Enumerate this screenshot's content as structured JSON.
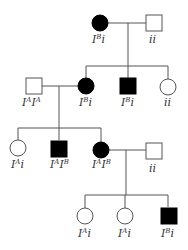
{
  "pedigree": {
    "colors": {
      "affected": "#000000",
      "unaffected": "#ffffff",
      "line": "#555555"
    },
    "generations": [
      {
        "id": "I",
        "individuals": [
          {
            "id": "I-1",
            "sex": "female",
            "affected": true,
            "genotype": {
              "base": "I",
              "sup": "B",
              "rest": "i"
            }
          },
          {
            "id": "I-2",
            "sex": "male",
            "affected": false,
            "genotype": {
              "base": "",
              "sup": "",
              "rest": "ii"
            }
          }
        ]
      },
      {
        "id": "II",
        "individuals": [
          {
            "id": "II-1",
            "sex": "male",
            "affected": false,
            "genotype": {
              "base": "I",
              "sup": "A",
              "rest": "I",
              "sup2": "A"
            }
          },
          {
            "id": "II-2",
            "sex": "female",
            "affected": true,
            "genotype": {
              "base": "I",
              "sup": "B",
              "rest": "i"
            }
          },
          {
            "id": "II-3",
            "sex": "male",
            "affected": true,
            "genotype": {
              "base": "I",
              "sup": "B",
              "rest": "i"
            }
          },
          {
            "id": "II-4",
            "sex": "female",
            "affected": false,
            "genotype": {
              "base": "",
              "sup": "",
              "rest": "ii"
            }
          }
        ]
      },
      {
        "id": "III",
        "individuals": [
          {
            "id": "III-1",
            "sex": "female",
            "affected": false,
            "genotype": {
              "base": "I",
              "sup": "A",
              "rest": "i"
            }
          },
          {
            "id": "III-2",
            "sex": "male",
            "affected": true,
            "genotype": {
              "base": "I",
              "sup": "A",
              "rest": "I",
              "sup2": "B"
            }
          },
          {
            "id": "III-3",
            "sex": "female",
            "affected": true,
            "genotype": {
              "base": "I",
              "sup": "A",
              "rest": "I",
              "sup2": "B"
            }
          },
          {
            "id": "III-4",
            "sex": "male",
            "affected": false,
            "genotype": {
              "base": "",
              "sup": "",
              "rest": "ii"
            }
          }
        ]
      },
      {
        "id": "IV",
        "individuals": [
          {
            "id": "IV-1",
            "sex": "female",
            "affected": false,
            "genotype": {
              "base": "I",
              "sup": "A",
              "rest": "i"
            }
          },
          {
            "id": "IV-2",
            "sex": "female",
            "affected": false,
            "genotype": {
              "base": "I",
              "sup": "A",
              "rest": "i"
            }
          },
          {
            "id": "IV-3",
            "sex": "male",
            "affected": true,
            "genotype": {
              "base": "I",
              "sup": "B",
              "rest": "i"
            }
          }
        ]
      }
    ]
  }
}
